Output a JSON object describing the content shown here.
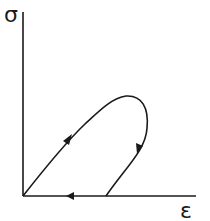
{
  "diagram": {
    "y_axis_label": "σ",
    "x_axis_label": "ε",
    "colors": {
      "stroke": "#1a1a1a",
      "background": "#ffffff"
    },
    "paths": [
      {
        "name": "loading-curve",
        "direction": "up-right",
        "arrow_at": [
          68,
          139
        ]
      },
      {
        "name": "unloading-curve",
        "direction": "down",
        "arrow_at": [
          139,
          148
        ]
      },
      {
        "name": "return-along-strain-axis",
        "direction": "left",
        "arrow_at": [
          72,
          196
        ]
      }
    ]
  }
}
